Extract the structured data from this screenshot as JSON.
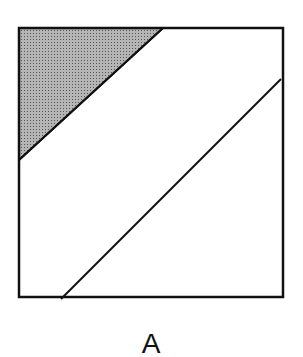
{
  "figure": {
    "label": "A",
    "square": {
      "x": 19,
      "y": 28,
      "width": 264,
      "height": 269
    },
    "shaded_triangle": {
      "points": "19,28 163,28 19,160",
      "fill": "#9a9a9a"
    },
    "upper_line": {
      "x1": 163,
      "y1": 28,
      "x2": 19,
      "y2": 160
    },
    "lower_line": {
      "x1": 61,
      "y1": 299,
      "x2": 281,
      "y2": 79
    },
    "stroke_color": "#111111"
  }
}
